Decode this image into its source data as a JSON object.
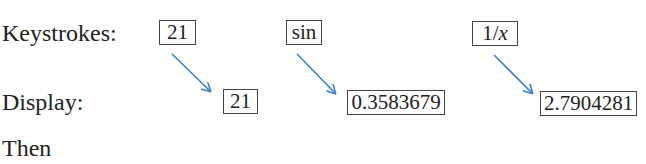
{
  "labels": {
    "keystrokes": "Keystrokes:",
    "display": "Display:",
    "then": "Then"
  },
  "steps": [
    {
      "keystroke": "21",
      "display": "21"
    },
    {
      "keystroke": "sin",
      "display": "0.3583679"
    },
    {
      "keystroke": "1/x",
      "display": "2.7904281"
    }
  ],
  "colors": {
    "arrow": "#3a7fd0",
    "box_border": "#444444",
    "text": "#222222"
  }
}
